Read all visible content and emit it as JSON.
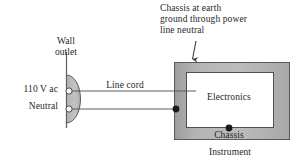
{
  "figure": {
    "type": "electrical-schematic"
  },
  "labels": {
    "chassis_ground_note": "Chassis at earth\nground through power\nline neutral",
    "wall_outlet": "Wall\noutlet",
    "supply_voltage": "110 V ac",
    "neutral": "Neutral",
    "line_cord": "Line cord",
    "electronics": "Electronics",
    "chassis": "Chassis",
    "instrument": "Instrument"
  },
  "colors": {
    "chassis_fill": "#a9a9a9",
    "chassis_fill_light": "#c8c8c8",
    "electronics_fill": "#ffffff",
    "outlet_fill": "#b8b8b8",
    "stroke": "#4a4a4a",
    "text": "#1f1f1f",
    "node_dot": "#1a1a1a"
  },
  "geometry": {
    "wall_line": {
      "x": 66,
      "y1": 52,
      "y2": 128
    },
    "outlet": {
      "cx": 66,
      "cy": 99,
      "rx": 14,
      "ry": 24
    },
    "outlet_terminals": [
      {
        "name": "line-terminal",
        "cx": 69,
        "cy": 91,
        "r": 3.1
      },
      {
        "name": "neutral-terminal",
        "cx": 69,
        "cy": 109,
        "r": 3.1
      }
    ],
    "line_wire": {
      "x1": 72,
      "y1": 91,
      "x2": 196,
      "y2": 91
    },
    "neutral_wire": {
      "x1": 72,
      "y1": 109,
      "x2": 176,
      "y2": 109
    },
    "chassis_box": {
      "x": 174,
      "y": 62,
      "w": 116,
      "h": 78
    },
    "electronics_box": {
      "x": 186,
      "y": 72,
      "w": 88,
      "h": 56
    },
    "nodes": [
      {
        "name": "neutral-chassis-node",
        "cx": 176,
        "cy": 109,
        "r": 3.4
      },
      {
        "name": "electronics-chassis-node",
        "cx": 229,
        "cy": 128,
        "r": 3.4
      }
    ],
    "arrow": {
      "x1": 196,
      "y1": 42,
      "x2": 192,
      "y2": 60
    }
  }
}
